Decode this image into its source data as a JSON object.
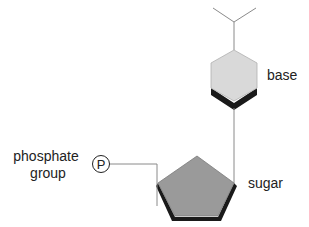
{
  "diagram": {
    "type": "nucleotide-structure",
    "labels": {
      "base": "base",
      "sugar": "sugar",
      "phosphate_line1": "phosphate",
      "phosphate_line2": "group",
      "phosphate_symbol": "P"
    },
    "colors": {
      "base_fill": "#d9d9d9",
      "sugar_fill": "#9a9a9a",
      "shadow": "#1a1a1a",
      "line": "#8a8a8a",
      "text": "#222222"
    },
    "components": [
      {
        "id": "base",
        "shape": "hexagon",
        "label": "base"
      },
      {
        "id": "sugar",
        "shape": "pentagon",
        "label": "sugar"
      },
      {
        "id": "phosphate",
        "shape": "circle",
        "label": "phosphate group",
        "symbol": "P"
      }
    ],
    "connections": [
      {
        "from": "base",
        "to": "sugar"
      },
      {
        "from": "phosphate",
        "to": "sugar"
      }
    ]
  }
}
